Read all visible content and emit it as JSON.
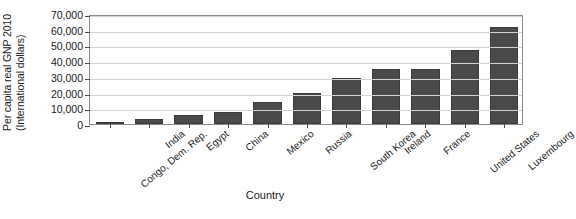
{
  "chart_data": {
    "type": "bar",
    "title": "",
    "xlabel": "Country",
    "ylabel": "Per capita real GNP 2010 (International dollars)",
    "ylabel_line1": "Per capita real GNP 2010",
    "ylabel_line2": "(International dollars)",
    "categories": [
      "Congo, Dem. Rep.",
      "India",
      "Egypt",
      "China",
      "Mexico",
      "Russia",
      "South Korea",
      "Ireland",
      "France",
      "United States",
      "Luxembourg"
    ],
    "values": [
      300,
      3300,
      5900,
      7400,
      14000,
      20000,
      29000,
      35000,
      35000,
      47000,
      62000
    ],
    "ylim": [
      0,
      70000
    ],
    "yticks": [
      0,
      10000,
      20000,
      30000,
      40000,
      50000,
      60000,
      70000
    ],
    "ytick_labels": [
      "0",
      "10,000",
      "20,000",
      "30,000",
      "40,000",
      "50,000",
      "60,000",
      "70,000"
    ],
    "grid": true,
    "legend": "none",
    "bar_color": "#4a4a4a",
    "grid_color": "#d2d2d2",
    "axis_color": "#8a8a8a"
  }
}
